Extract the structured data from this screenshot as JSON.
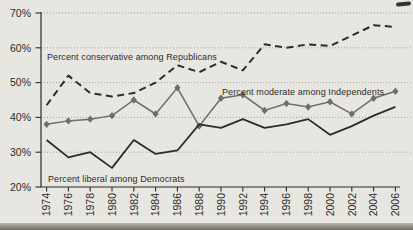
{
  "chart_data": {
    "type": "line",
    "title": "",
    "xlabel": "",
    "ylabel": "",
    "ylim": [
      20,
      70
    ],
    "grid": "horizontal-dotted",
    "legend": "inline-annotations",
    "x": [
      1974,
      1976,
      1978,
      1980,
      1982,
      1984,
      1986,
      1988,
      1990,
      1992,
      1994,
      1996,
      1998,
      2000,
      2002,
      2004,
      2006
    ],
    "x_tick_labels": [
      "1974",
      "1976",
      "1978",
      "1980",
      "1982",
      "1984",
      "1986",
      "1988",
      "1990",
      "1992",
      "1994",
      "1996",
      "1998",
      "2000",
      "2002",
      "2004",
      "2006"
    ],
    "y_tick_values": [
      70,
      60,
      50,
      40,
      30,
      20
    ],
    "y_tick_labels": [
      "70%",
      "60%",
      "50%",
      "40%",
      "30%",
      "20%"
    ],
    "series": [
      {
        "name": "conservative-republicans",
        "label": "Percent conservative among Republicans",
        "style": "dashed-black",
        "values": [
          43.5,
          52,
          47,
          46,
          47,
          50,
          55,
          53,
          56,
          53.5,
          61,
          60,
          61,
          60.5,
          63.5,
          66.5,
          66
        ]
      },
      {
        "name": "moderate-independents",
        "label": "Percent moderate among Independents",
        "style": "solid-gray-diamond-markers",
        "values": [
          38,
          39,
          39.5,
          40.5,
          45,
          41,
          48.5,
          37.5,
          45.5,
          46.5,
          42,
          44,
          43,
          44.5,
          41,
          45.5,
          47.5
        ]
      },
      {
        "name": "liberal-democrats",
        "label": "Percent liberal among Democrats",
        "style": "solid-black",
        "values": [
          33.5,
          28.5,
          30,
          25.5,
          33.5,
          29.5,
          30.5,
          38,
          37,
          39.5,
          37,
          38,
          39.5,
          35,
          37.5,
          40.5,
          43
        ]
      }
    ]
  },
  "colors": {
    "background": "#e8e6e1",
    "ink": "#2e2c28",
    "gray_line": "#6e6d68",
    "grid": "#a3a199",
    "text": "#2e2c28"
  }
}
